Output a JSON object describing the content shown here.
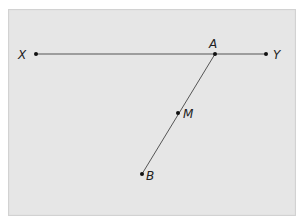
{
  "diagram": {
    "type": "geometry",
    "points": {
      "X": {
        "label": "X",
        "x": 36,
        "y": 54
      },
      "A": {
        "label": "A",
        "x": 215,
        "y": 54
      },
      "Y": {
        "label": "Y",
        "x": 266,
        "y": 54
      },
      "M": {
        "label": "M",
        "x": 178,
        "y": 113
      },
      "B": {
        "label": "B",
        "x": 142,
        "y": 174
      }
    },
    "segments": [
      {
        "from": "X",
        "to": "Y"
      },
      {
        "from": "A",
        "to": "B"
      }
    ],
    "colors": {
      "background": "#e6e6e6",
      "line": "#555555",
      "point": "#111111"
    }
  }
}
